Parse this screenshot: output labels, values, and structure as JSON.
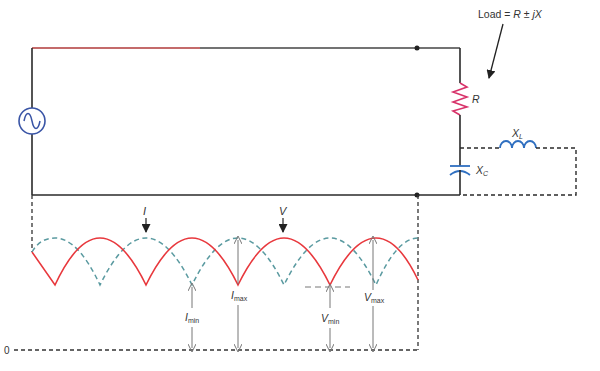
{
  "colors": {
    "wire": "#2a2a2a",
    "voltage_wave": "#e8383d",
    "current_wave": "#5a9aa0",
    "resistor": "#d8336a",
    "reactive": "#2f6fc0",
    "source": "#3a55a6",
    "dimension": "#777777"
  },
  "labels": {
    "load_prefix": "Load = ",
    "load_formula": "R ± jX",
    "resistor": "R",
    "inductor_main": "X",
    "inductor_sub": "L",
    "capacitor_main": "X",
    "capacitor_sub": "C",
    "current_wave": "I",
    "voltage_wave": "V",
    "i_max_main": "I",
    "i_max_sub": "max",
    "i_min_main": "I",
    "i_min_sub": "min",
    "v_max_main": "V",
    "v_max_sub": "max",
    "v_min_main": "V",
    "v_min_sub": "min",
    "baseline": "0"
  },
  "components": [
    {
      "type": "ac-source",
      "label": "~"
    },
    {
      "type": "resistor",
      "label": "R"
    },
    {
      "type": "inductor",
      "label": "XL"
    },
    {
      "type": "capacitor",
      "label": "XC"
    }
  ],
  "waveforms": {
    "voltage": {
      "style": "solid",
      "peaks_x": [
        100,
        192,
        284,
        376
      ],
      "troughs_x": [
        55,
        146,
        238,
        330,
        418
      ]
    },
    "current": {
      "style": "dashed",
      "peaks_x": [
        55,
        146,
        238,
        330,
        418
      ],
      "troughs_x": [
        100,
        192,
        284,
        376
      ]
    }
  }
}
